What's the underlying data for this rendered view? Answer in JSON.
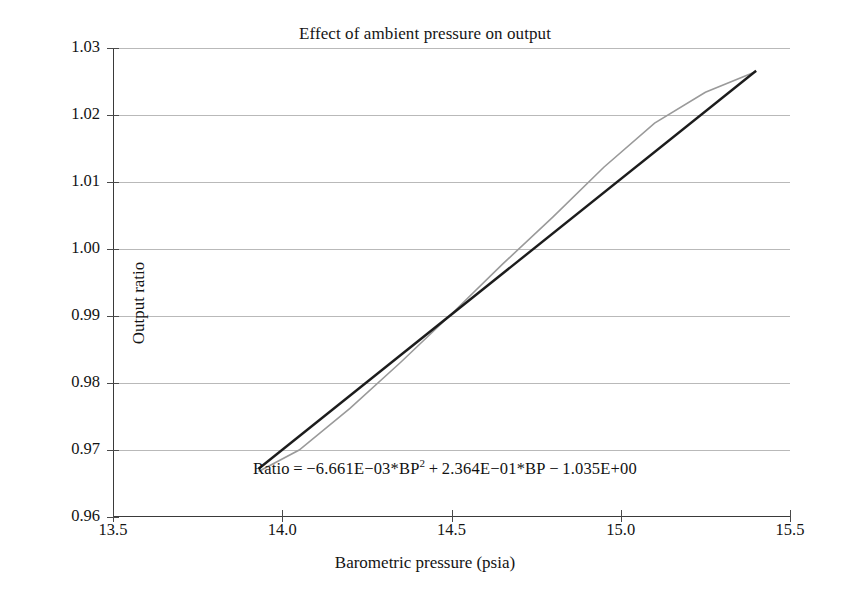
{
  "chart_data": {
    "type": "line",
    "title": "Effect of ambient pressure on output",
    "xlabel": "Barometric pressure (psia)",
    "ylabel": "Output ratio",
    "xlim": [
      13.5,
      15.5
    ],
    "ylim": [
      0.96,
      1.03
    ],
    "xticks": [
      "13.5",
      "14.0",
      "14.5",
      "15.0",
      "15.5"
    ],
    "xtick_values": [
      13.5,
      14.0,
      14.5,
      15.0,
      15.5
    ],
    "yticks": [
      "1.03",
      "1.02",
      "1.01",
      "1.00",
      "0.99",
      "0.98",
      "0.97",
      "0.96"
    ],
    "ytick_values": [
      1.03,
      1.02,
      1.01,
      1.0,
      0.99,
      0.98,
      0.97,
      0.96
    ],
    "grid": "horizontal",
    "legend": "none",
    "annotation": "Ratio = −6.661E−03*BP² + 2.364E−01*BP − 1.035E+00",
    "annotation_parts": {
      "lead": "Ratio = −6.661E−03*BP",
      "exponent": "2",
      "tail": " + 2.364E−01*BP − 1.035E+00"
    },
    "series": [
      {
        "name": "Quadratic fit",
        "color": "#9a9a9a",
        "width": 1.6,
        "x": [
          13.93,
          14.05,
          14.2,
          14.35,
          14.5,
          14.65,
          14.8,
          14.95,
          15.1,
          15.25,
          15.4
        ],
        "values": [
          0.9668,
          0.97,
          0.9762,
          0.9831,
          0.9903,
          0.9977,
          1.0048,
          1.0122,
          1.0188,
          1.0234,
          1.0265
        ]
      },
      {
        "name": "Linear trend",
        "color": "#1c1c1c",
        "width": 2.4,
        "x": [
          13.93,
          15.4
        ],
        "values": [
          0.9672,
          1.0266
        ]
      }
    ],
    "colors": {
      "quadratic": "#9a9a9a",
      "linear": "#1c1c1c",
      "grid": "#b9b9b9",
      "axis": "#3a3a3a",
      "background": "#ffffff"
    }
  }
}
